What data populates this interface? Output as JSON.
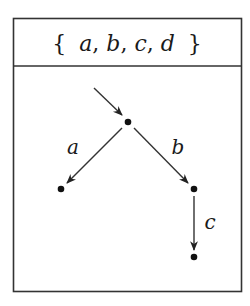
{
  "title": {
    "open_brace": "{",
    "close_brace": "}",
    "elements": [
      "a",
      "b",
      "c",
      "d"
    ],
    "separator": ","
  },
  "graph": {
    "start_arrow": {
      "to": "root"
    },
    "nodes": [
      {
        "id": "root"
      },
      {
        "id": "left"
      },
      {
        "id": "right"
      },
      {
        "id": "bottom"
      }
    ],
    "edges": [
      {
        "from": "root",
        "to": "left",
        "label": "a"
      },
      {
        "from": "root",
        "to": "right",
        "label": "b"
      },
      {
        "from": "right",
        "to": "bottom",
        "label": "c"
      }
    ]
  },
  "colors": {
    "stroke": "#333333",
    "node": "#111111"
  }
}
